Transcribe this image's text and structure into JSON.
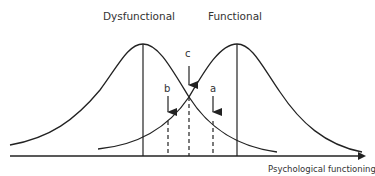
{
  "diagram": {
    "title_left": "Dysfunctional",
    "title_right": "Functional",
    "x_axis_label": "Psychological functioning",
    "markers": {
      "a": "a",
      "b": "b",
      "c": "c"
    },
    "line_color": "#222222"
  }
}
